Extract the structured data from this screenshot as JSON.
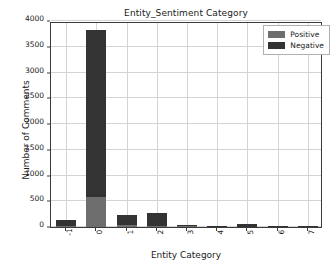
{
  "chart_data": {
    "type": "bar",
    "subtype": "stacked-bar",
    "title": "Entity_Sentiment Category",
    "xlabel": "Entity Category",
    "ylabel": "Number of Comments",
    "categories": [
      "-1",
      "0",
      "1",
      "2",
      "3",
      "4",
      "5",
      "6",
      "7"
    ],
    "series": [
      {
        "name": "Positive",
        "color": "#6e6e6e",
        "values": [
          20,
          580,
          35,
          20,
          25,
          2,
          8,
          6,
          5
        ]
      },
      {
        "name": "Negative",
        "color": "#333333",
        "values": [
          110,
          3250,
          205,
          260,
          10,
          2,
          45,
          12,
          8
        ]
      }
    ],
    "totals": [
      130,
      3830,
      240,
      280,
      35,
      4,
      53,
      18,
      13
    ],
    "ylim": [
      0,
      4000
    ],
    "yticks": [
      0,
      500,
      1000,
      1500,
      2000,
      2500,
      3000,
      3500,
      4000
    ],
    "ytick_labels": [
      "0",
      "500",
      "1000",
      "1500",
      "2000",
      "2500",
      "3000",
      "3500",
      "4000"
    ],
    "grid": true,
    "grid_axis": "both",
    "legend_position": "upper right",
    "xtick_rotation": -90,
    "background_color": "#ffffff",
    "axes_edge_color": "#3a3a3a",
    "grid_color": "#d4d4d4"
  }
}
